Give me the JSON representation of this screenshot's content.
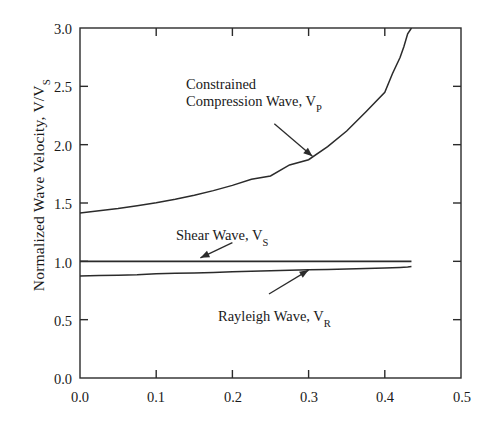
{
  "chart_data": {
    "type": "line",
    "title": "",
    "xlabel": "",
    "ylabel": "Normalized Wave Velocity, V/V",
    "ylabel_sub": "S",
    "xlim": [
      0.0,
      0.5
    ],
    "ylim": [
      0.0,
      3.0
    ],
    "grid": false,
    "legend": "none (inline annotations with leader arrows)",
    "xticks": [
      "0.0",
      "0.1",
      "0.2",
      "0.3",
      "0.4",
      "0.5"
    ],
    "xtick_values": [
      0.0,
      0.1,
      0.2,
      0.3,
      0.4,
      0.5
    ],
    "yticks": [
      "0.0",
      "0.5",
      "1.0",
      "1.5",
      "2.0",
      "2.5",
      "3.0"
    ],
    "ytick_values": [
      0.0,
      0.5,
      1.0,
      1.5,
      2.0,
      2.5,
      3.0
    ],
    "x": [
      0.0,
      0.025,
      0.05,
      0.075,
      0.1,
      0.125,
      0.15,
      0.175,
      0.2,
      0.225,
      0.25,
      0.275,
      0.3,
      0.325,
      0.35,
      0.375,
      0.4,
      0.41,
      0.42,
      0.425,
      0.43,
      0.435
    ],
    "series": [
      {
        "name": "Constrained Compression Wave, V_P",
        "label": "Constrained Compression Wave, V",
        "label_sub": "P",
        "values": [
          1.414,
          1.433,
          1.453,
          1.477,
          1.503,
          1.533,
          1.567,
          1.606,
          1.651,
          1.703,
          1.732,
          1.826,
          1.871,
          1.983,
          2.117,
          2.28,
          2.449,
          2.608,
          2.747,
          2.84,
          2.95,
          3.0
        ]
      },
      {
        "name": "Shear Wave, V_S",
        "label": "Shear Wave, V",
        "label_sub": "S",
        "values": [
          1.0,
          1.0,
          1.0,
          1.0,
          1.0,
          1.0,
          1.0,
          1.0,
          1.0,
          1.0,
          1.0,
          1.0,
          1.0,
          1.0,
          1.0,
          1.0,
          1.0,
          1.0,
          1.0,
          1.0,
          1.0,
          1.0
        ]
      },
      {
        "name": "Rayleigh Wave, V_R",
        "label": "Rayleigh Wave, V",
        "label_sub": "R",
        "values": [
          0.874,
          0.878,
          0.881,
          0.885,
          0.893,
          0.897,
          0.901,
          0.905,
          0.911,
          0.916,
          0.919,
          0.923,
          0.927,
          0.93,
          0.934,
          0.938,
          0.942,
          0.944,
          0.947,
          0.949,
          0.951,
          0.955
        ]
      }
    ],
    "annotations": [
      {
        "name": "compression-wave-annotation",
        "line1": "Constrained",
        "line2": "Compression Wave, V",
        "sub": "P",
        "arrow_from": [
          0.255,
          2.18
        ],
        "arrow_to": [
          0.305,
          1.9
        ]
      },
      {
        "name": "shear-wave-annotation",
        "text": "Shear Wave, V",
        "sub": "S",
        "arrow_from": [
          0.2,
          1.16
        ],
        "arrow_to": [
          0.158,
          1.03
        ]
      },
      {
        "name": "rayleigh-wave-annotation",
        "text": "Rayleigh Wave, V",
        "sub": "R",
        "arrow_from": [
          0.248,
          0.72
        ],
        "arrow_to": [
          0.3,
          0.925
        ]
      }
    ]
  }
}
